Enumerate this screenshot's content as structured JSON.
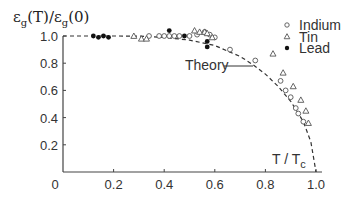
{
  "chart_data": {
    "type": "scatter",
    "title": "",
    "ylabel": "εg(T)/εg(0)",
    "ylabel_parts": {
      "eps1": "ε",
      "sub1": "g",
      "mid": "(T)/",
      "eps2": "ε",
      "sub2": "g",
      "end": "(0)"
    },
    "xlabel": "T / Tc",
    "xlabel_parts": {
      "main": "T / T",
      "sub": "c"
    },
    "xlim": [
      0,
      1.0
    ],
    "ylim": [
      0,
      1.0
    ],
    "x_ticks": [
      "0",
      "0.2",
      "0.4",
      "0.6",
      "0.8",
      "1.0"
    ],
    "y_ticks": [
      "0.2",
      "0.4",
      "0.6",
      "0.8",
      "1.0"
    ],
    "grid": false,
    "legend_position": "upper right",
    "legend": [
      {
        "label": "Indium",
        "marker": "open-circle"
      },
      {
        "label": "Tin",
        "marker": "open-triangle"
      },
      {
        "label": "Lead",
        "marker": "filled-circle"
      }
    ],
    "annotations": [
      {
        "text": "Theory",
        "points_to": [
          0.75,
          0.78
        ]
      }
    ],
    "series": [
      {
        "name": "Theory",
        "style": "dashed-line",
        "x": [
          0.0,
          0.1,
          0.2,
          0.3,
          0.4,
          0.5,
          0.55,
          0.6,
          0.65,
          0.7,
          0.75,
          0.8,
          0.85,
          0.9,
          0.95,
          0.98,
          1.0
        ],
        "y": [
          1.0,
          1.0,
          1.0,
          0.999,
          0.99,
          0.97,
          0.95,
          0.93,
          0.89,
          0.85,
          0.79,
          0.72,
          0.63,
          0.52,
          0.37,
          0.22,
          0.0
        ]
      },
      {
        "name": "Indium",
        "marker": "open-circle",
        "x": [
          0.34,
          0.38,
          0.4,
          0.42,
          0.44,
          0.46,
          0.5,
          0.53,
          0.56,
          0.58,
          0.6,
          0.66,
          0.76,
          0.86,
          0.88,
          0.9,
          0.92,
          0.93,
          0.95
        ],
        "y": [
          1.0,
          1.0,
          1.0,
          1.0,
          1.0,
          1.0,
          1.0,
          1.01,
          1.03,
          1.01,
          0.99,
          0.9,
          0.82,
          0.67,
          0.6,
          0.55,
          0.47,
          0.43,
          0.37
        ]
      },
      {
        "name": "Tin",
        "marker": "open-triangle",
        "x": [
          0.28,
          0.31,
          0.33,
          0.52,
          0.54,
          0.56,
          0.57,
          0.59,
          0.83,
          0.87,
          0.91,
          0.94,
          0.96,
          0.97
        ],
        "y": [
          1.0,
          0.98,
          0.98,
          1.04,
          1.03,
          1.03,
          1.02,
          0.99,
          0.87,
          0.73,
          0.63,
          0.53,
          0.45,
          0.36
        ]
      },
      {
        "name": "Lead",
        "marker": "filled-circle",
        "x": [
          0.12,
          0.14,
          0.16,
          0.18,
          0.42,
          0.48,
          0.57,
          0.57
        ],
        "y": [
          1.0,
          0.99,
          1.0,
          0.99,
          1.04,
          1.0,
          0.96,
          0.92
        ]
      }
    ]
  }
}
